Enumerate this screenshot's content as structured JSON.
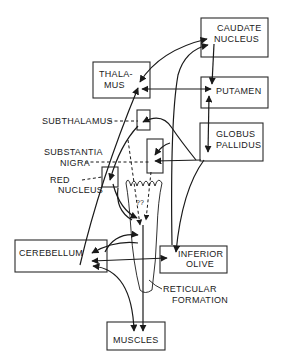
{
  "diagram": {
    "type": "motor-system pathway diagram",
    "nodes": {
      "caudate": {
        "line1": "CAUDATE",
        "line2": "NUCLEUS"
      },
      "thalamus": {
        "line1": "THALA-",
        "line2": "MUS"
      },
      "putamen": {
        "label": "PUTAMEN"
      },
      "globus": {
        "line1": "GLOBUS",
        "line2": "PALLIDUS"
      },
      "cerebellum": {
        "label": "CEREBELLUM"
      },
      "olive": {
        "line1": "INFERIOR",
        "line2": "OLIVE"
      },
      "muscles": {
        "label": "MUSCLES"
      }
    },
    "callouts": {
      "subthalamus": "SUBTHALAMUS",
      "substantia_line1": "SUBSTANTIA",
      "substantia_line2": "NIGRA",
      "red_line1": "RED",
      "red_line2": "NUCLEUS",
      "reticular_line1": "RETICULAR",
      "reticular_line2": "FORMATION"
    },
    "annotations": {
      "uncertain": "??"
    },
    "colors": {
      "ink": "#1a1a1a",
      "background": "#ffffff"
    }
  }
}
